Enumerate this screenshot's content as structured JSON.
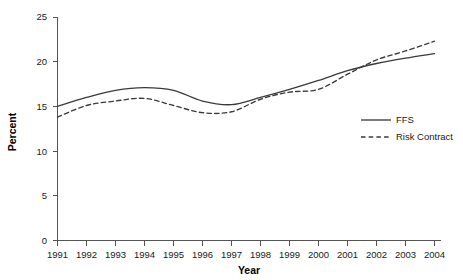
{
  "chart_data": {
    "type": "line",
    "title": "",
    "xlabel": "Year",
    "ylabel": "Percent",
    "x": [
      1991,
      1992,
      1993,
      1994,
      1995,
      1996,
      1997,
      1998,
      1999,
      2000,
      2001,
      2002,
      2003,
      2004
    ],
    "xtick_labels": [
      "1991",
      "1992",
      "1993",
      "1994",
      "1995",
      "1996",
      "1997",
      "1998",
      "1999",
      "2000",
      "2001",
      "2002",
      "2003",
      "2004"
    ],
    "ytick_labels": [
      "0",
      "5",
      "10",
      "15",
      "20",
      "25"
    ],
    "yticks": [
      0,
      5,
      10,
      15,
      20,
      25
    ],
    "ylim": [
      0,
      25
    ],
    "xlim": [
      1991,
      2004
    ],
    "grid": false,
    "legend_position": "center-right",
    "series": [
      {
        "name": "FFS",
        "style": "solid",
        "color": "#3a3a3a",
        "values": [
          15.0,
          16.0,
          16.8,
          17.1,
          16.8,
          15.6,
          15.2,
          16.0,
          16.9,
          17.9,
          19.0,
          19.8,
          20.4,
          20.9
        ]
      },
      {
        "name": "Risk Contract",
        "style": "dashed",
        "color": "#3a3a3a",
        "values": [
          13.8,
          15.1,
          15.6,
          15.9,
          15.1,
          14.3,
          14.4,
          15.8,
          16.6,
          16.9,
          18.6,
          20.2,
          21.2,
          22.3
        ]
      }
    ]
  },
  "legend": {
    "entries": [
      {
        "label": "FFS",
        "style": "solid"
      },
      {
        "label": "Risk Contract",
        "style": "dashed"
      }
    ]
  }
}
